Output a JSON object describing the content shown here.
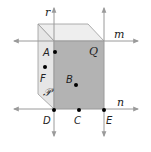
{
  "diagram": {
    "title": "",
    "colors": {
      "front_face": "#b3b3b3",
      "side_face": "#e6e6e6",
      "top_face": "#eeeeee",
      "line": "#9a9a9a",
      "arrow": "#9a9a9a",
      "point": "#000000",
      "label": "#222222"
    },
    "lines": [
      {
        "id": "r",
        "label": "r",
        "orientation": "vertical"
      },
      {
        "id": "m",
        "label": "m",
        "orientation": "horizontal"
      },
      {
        "id": "n",
        "label": "n",
        "orientation": "horizontal"
      },
      {
        "id": "vertical-right",
        "label": "",
        "orientation": "vertical"
      }
    ],
    "planes": [
      {
        "id": "P",
        "label": "𝒫"
      },
      {
        "id": "Q",
        "label": "Q"
      }
    ],
    "points": [
      {
        "id": "A",
        "label": "A"
      },
      {
        "id": "B",
        "label": "B"
      },
      {
        "id": "C",
        "label": "C"
      },
      {
        "id": "D",
        "label": "D"
      },
      {
        "id": "E",
        "label": "E"
      },
      {
        "id": "F",
        "label": "F"
      }
    ]
  }
}
